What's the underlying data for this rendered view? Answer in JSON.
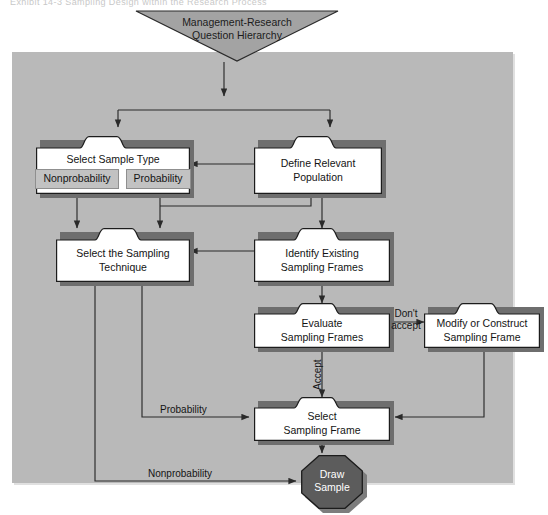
{
  "caption": "Exhibit 14-3 Sampling Design within the Research Process",
  "canvas": {
    "width": 548,
    "height": 515
  },
  "colors": {
    "panel_background": "#b9b9b9",
    "node_fill": "#ffffff",
    "node_stroke": "#1c1c1c",
    "node_shadow": "#6e6e6e",
    "subbox_fill": "#c2c2c2",
    "triangle_fill": "#a3a3a3",
    "terminator_fill": "#5c5c5c",
    "terminator_text": "#ffffff",
    "connector": "#2a2a2a"
  },
  "diagram": {
    "type": "flowchart",
    "start": {
      "id": "mgmt-research-question-hierarchy",
      "shape": "inverted-triangle",
      "lines": [
        "Management-Research",
        "Question Hierarchy"
      ]
    },
    "nodes": [
      {
        "id": "select-sample-type",
        "shape": "folder-tab-box",
        "lines": [
          "Select Sample Type"
        ],
        "sub_options": [
          "Nonprobability",
          "Probability"
        ]
      },
      {
        "id": "define-relevant-population",
        "shape": "folder-tab-box",
        "lines": [
          "Define Relevant",
          "Population"
        ],
        "sub_options": []
      },
      {
        "id": "select-the-sampling-technique",
        "shape": "folder-tab-box",
        "lines": [
          "Select the Sampling",
          "Technique"
        ],
        "sub_options": []
      },
      {
        "id": "identify-existing-sampling-frames",
        "shape": "folder-tab-box",
        "lines": [
          "Identify Existing",
          "Sampling Frames"
        ],
        "sub_options": []
      },
      {
        "id": "evaluate-sampling-frames",
        "shape": "folder-tab-box",
        "lines": [
          "Evaluate",
          "Sampling Frames"
        ],
        "sub_options": []
      },
      {
        "id": "modify-or-construct-sampling-frame",
        "shape": "folder-tab-box",
        "lines": [
          "Modify or Construct",
          "Sampling Frame"
        ],
        "sub_options": []
      },
      {
        "id": "select-sampling-frame",
        "shape": "folder-tab-box",
        "lines": [
          "Select",
          "Sampling Frame"
        ],
        "sub_options": []
      }
    ],
    "end": {
      "id": "draw-sample",
      "shape": "octagon",
      "lines": [
        "Draw",
        "Sample"
      ]
    },
    "edge_labels": [
      {
        "id": "dont-accept",
        "lines": [
          "Don't",
          "accept"
        ],
        "orientation": "horizontal"
      },
      {
        "id": "accept",
        "lines": [
          "Accept"
        ],
        "orientation": "vertical"
      },
      {
        "id": "probability",
        "lines": [
          "Probability"
        ],
        "orientation": "horizontal"
      },
      {
        "id": "nonprobability",
        "lines": [
          "Nonprobability"
        ],
        "orientation": "horizontal"
      }
    ]
  }
}
